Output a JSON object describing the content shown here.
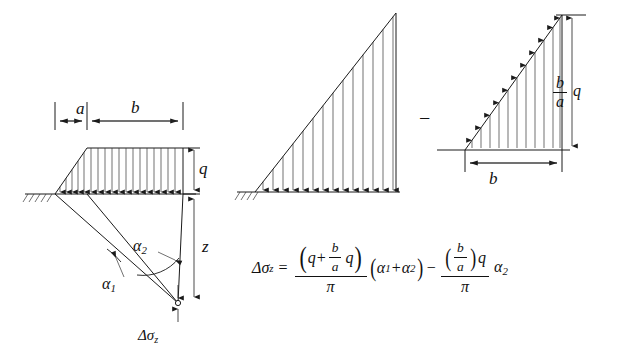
{
  "figure": {
    "labels": {
      "dim_a": "a",
      "dim_b": "b",
      "load_q": "q",
      "depth_z": "z",
      "alpha1": "α1",
      "alpha2": "α2",
      "delta_sigma_z": "Δσz",
      "minus_operator": "−",
      "right_triangle_peak": "b/a q",
      "right_triangle_base": "b"
    },
    "panels": [
      {
        "name": "trapezoidal-load-panel",
        "caption": "Trapezoidal load with ground surface, ray angles alpha1 and alpha2 to point O at depth z"
      },
      {
        "name": "large-triangular-load-panel",
        "caption": "Full triangular load of height (q + b/a q) over span (a + b)"
      },
      {
        "name": "small-triangular-load-panel",
        "caption": "Subtracted triangular load of height b/a q over span b"
      }
    ],
    "equation": {
      "lhs_symbol": "Δσ",
      "lhs_sub": "z",
      "equals": "=",
      "term1": {
        "numerator_parts": [
          "q",
          "+",
          "b",
          "a",
          "q"
        ],
        "numerator_text": "(q + (b/a) q)",
        "denominator": "π",
        "multiplier": "(α1 + α2)"
      },
      "operator": "−",
      "term2": {
        "numerator_text": "((b/a) q)",
        "denominator": "π",
        "multiplier": "α2"
      },
      "plain_text": "Δσz = ((q + (b/a)q)/π)(α1+α2) − (((b/a)q)/π)α2"
    },
    "symbols": {
      "q_char": "q",
      "a_char": "a",
      "b_char": "b",
      "pi_char": "π",
      "alpha_char": "α",
      "sigma_char": "σ",
      "delta_char": "Δ",
      "z_char": "z",
      "sub_1": "1",
      "sub_2": "2",
      "plus": "+",
      "equals": "=",
      "open_paren": "(",
      "close_paren": ")"
    },
    "colors": {
      "ink": "#1a1a1a",
      "background": "#ffffff"
    }
  }
}
